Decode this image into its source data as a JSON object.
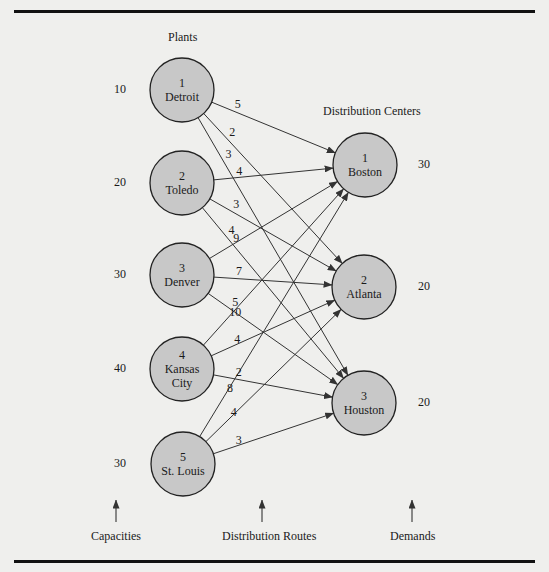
{
  "headings": {
    "plants": "Plants",
    "distribution_centers": "Distribution Centers"
  },
  "footer": {
    "capacities": "Capacities",
    "routes": "Distribution Routes",
    "demands": "Demands"
  },
  "colors": {
    "node_fill": "#c8c8c8",
    "node_stroke": "#222222",
    "edge": "#333333",
    "background": "#efefed",
    "rule": "#111111"
  },
  "plants": [
    {
      "id": "1",
      "name": "Detroit",
      "lines": [
        "1",
        "Detroit"
      ],
      "capacity": "10",
      "cx": 182,
      "cy": 90
    },
    {
      "id": "2",
      "name": "Toledo",
      "lines": [
        "2",
        "Toledo"
      ],
      "capacity": "20",
      "cx": 182,
      "cy": 183
    },
    {
      "id": "3",
      "name": "Denver",
      "lines": [
        "3",
        "Denver"
      ],
      "capacity": "30",
      "cx": 182,
      "cy": 275
    },
    {
      "id": "4",
      "name": "Kansas City",
      "lines": [
        "4",
        "Kansas",
        "City"
      ],
      "capacity": "40",
      "cx": 182,
      "cy": 369
    },
    {
      "id": "5",
      "name": "St. Louis",
      "lines": [
        "5",
        "St. Louis"
      ],
      "capacity": "30",
      "cx": 183,
      "cy": 464
    }
  ],
  "centers": [
    {
      "id": "1",
      "name": "Boston",
      "lines": [
        "1",
        "Boston"
      ],
      "demand": "30",
      "cx": 365,
      "cy": 165
    },
    {
      "id": "2",
      "name": "Atlanta",
      "lines": [
        "2",
        "Atlanta"
      ],
      "demand": "20",
      "cx": 364,
      "cy": 287
    },
    {
      "id": "3",
      "name": "Houston",
      "lines": [
        "3",
        "Houston"
      ],
      "demand": "20",
      "cx": 364,
      "cy": 403
    }
  ],
  "routes": [
    {
      "from": 0,
      "to": 0,
      "cost": "5"
    },
    {
      "from": 0,
      "to": 1,
      "cost": "2"
    },
    {
      "from": 0,
      "to": 2,
      "cost": "3"
    },
    {
      "from": 1,
      "to": 0,
      "cost": "4"
    },
    {
      "from": 1,
      "to": 1,
      "cost": "3"
    },
    {
      "from": 1,
      "to": 2,
      "cost": "4"
    },
    {
      "from": 2,
      "to": 0,
      "cost": "9"
    },
    {
      "from": 2,
      "to": 1,
      "cost": "7"
    },
    {
      "from": 2,
      "to": 2,
      "cost": "5"
    },
    {
      "from": 3,
      "to": 0,
      "cost": "10"
    },
    {
      "from": 3,
      "to": 1,
      "cost": "4"
    },
    {
      "from": 3,
      "to": 2,
      "cost": "2"
    },
    {
      "from": 4,
      "to": 0,
      "cost": "8"
    },
    {
      "from": 4,
      "to": 1,
      "cost": "4"
    },
    {
      "from": 4,
      "to": 2,
      "cost": "3"
    }
  ],
  "node_radius": 32
}
